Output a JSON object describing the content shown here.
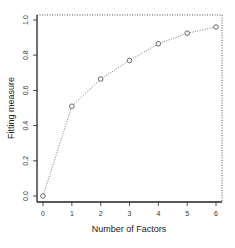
{
  "chart_data": {
    "type": "line",
    "title": "",
    "xlabel": "Number of Factors",
    "ylabel": "Fitting measure",
    "x": [
      0,
      1,
      2,
      3,
      4,
      5,
      6
    ],
    "values": [
      0.0,
      0.51,
      0.665,
      0.77,
      0.865,
      0.925,
      0.96
    ],
    "series": [
      {
        "name": "Fitting measure",
        "values": [
          0.0,
          0.51,
          0.665,
          0.77,
          0.865,
          0.925,
          0.96
        ]
      }
    ],
    "xlim": [
      0,
      6
    ],
    "ylim": [
      0,
      1.0
    ],
    "x_ticks": [
      "0",
      "1",
      "2",
      "3",
      "4",
      "5",
      "6"
    ],
    "y_ticks": [
      "0.0",
      "0.2",
      "0.4",
      "0.6",
      "0.8",
      "1.0"
    ],
    "reference_lines": [
      {
        "type": "horizontal",
        "y": 1.0,
        "style": "dotted"
      },
      {
        "type": "vertical",
        "x": 6.2,
        "style": "dotted"
      }
    ],
    "marker": "open-circle",
    "line_style": "dotted",
    "grid": false,
    "legend": "none"
  },
  "labels": {
    "xlabel": "Number of Factors",
    "ylabel": "Fitting measure"
  }
}
